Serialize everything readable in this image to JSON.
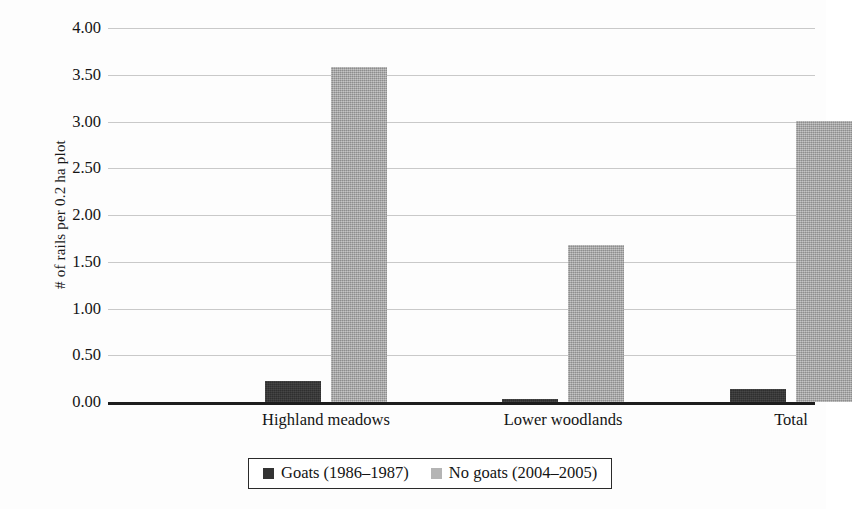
{
  "chart_data": {
    "type": "bar",
    "title": "",
    "xlabel": "",
    "ylabel": "# of rails per 0.2 ha plot",
    "categories": [
      "Highland meadows",
      "Lower woodlands",
      "Total"
    ],
    "series": [
      {
        "name": "Goats (1986–1987)",
        "color": "#333333",
        "values": [
          0.23,
          0.03,
          0.14
        ]
      },
      {
        "name": "No goats (2004–2005)",
        "color": "#adadad",
        "values": [
          3.58,
          1.68,
          3.01
        ]
      }
    ],
    "ylim": [
      0.0,
      4.0
    ],
    "ytick_step": 0.5,
    "yticks": [
      "0.00",
      "0.50",
      "1.00",
      "1.50",
      "2.00",
      "2.50",
      "3.00",
      "3.50",
      "4.00"
    ],
    "ytick_values": [
      0.0,
      0.5,
      1.0,
      1.5,
      2.0,
      2.5,
      3.0,
      3.5,
      4.0
    ],
    "grid": true,
    "legend_position": "bottom",
    "legend_border": true
  },
  "legend": {
    "items": [
      {
        "label": "Goats (1986–1987)",
        "color": "#333333"
      },
      {
        "label": "No goats (2004–2005)",
        "color": "#adadad"
      }
    ]
  },
  "axis": {
    "y_title": "# of rails per 0.2 ha plot"
  }
}
